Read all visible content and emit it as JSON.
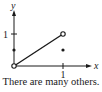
{
  "diagram": {
    "axis_labels": {
      "x": "x",
      "y": "y"
    },
    "tick_labels": {
      "x_one": "1",
      "y_one": "1"
    },
    "segment": {
      "from": [
        0,
        0
      ],
      "to": [
        1,
        1
      ],
      "endpoints": "open"
    },
    "points": [
      {
        "x": 0,
        "y": 0.5,
        "style": "filled"
      },
      {
        "x": 1,
        "y": 0.5,
        "style": "filled"
      }
    ],
    "caption": "There are many others."
  }
}
